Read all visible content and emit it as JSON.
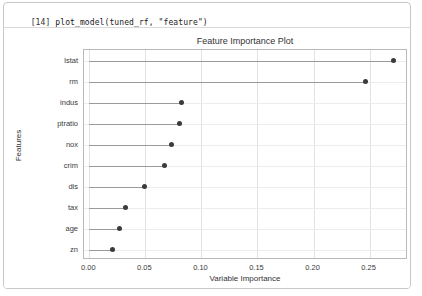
{
  "notebook": {
    "cell_prompt": "[14]",
    "code": "plot_model(tuned_rf, \"feature\")"
  },
  "chart_data": {
    "type": "scatter",
    "title": "Feature Importance Plot",
    "xlabel": "Variable Importance",
    "ylabel": "Features",
    "xlim": [
      -0.0048,
      0.2843
    ],
    "xticks": [
      0.0,
      0.05,
      0.1,
      0.15,
      0.2,
      0.25
    ],
    "xtick_labels": [
      "0.00",
      "0.05",
      "0.10",
      "0.15",
      "0.20",
      "0.25"
    ],
    "categories": [
      "lstat",
      "rm",
      "indus",
      "ptratio",
      "nox",
      "crim",
      "dis",
      "tax",
      "age",
      "zn"
    ],
    "values": [
      0.271,
      0.246,
      0.0825,
      0.08,
      0.073,
      0.067,
      0.049,
      0.032,
      0.027,
      0.021
    ],
    "grid": "both",
    "legend": "none",
    "marker": "circle",
    "marker_color": "#3b3b3b",
    "stem_color": "#9a9a9a"
  },
  "colors": {
    "card_border": "#c8c8c8",
    "plot_border": "#b9b9b9",
    "vgrid": "#e2e2e2",
    "hgrid": "#ececec",
    "text": "#333333",
    "background": "#ffffff"
  }
}
